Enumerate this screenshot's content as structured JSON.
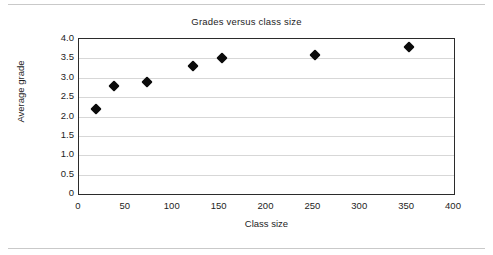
{
  "chart_data": {
    "type": "scatter",
    "title": "Grades versus class size",
    "xlabel": "Class size",
    "ylabel": "Average grade",
    "xlim": [
      0,
      400
    ],
    "ylim": [
      0,
      4.0
    ],
    "grid": true,
    "legend": null,
    "xticks": [
      "0",
      "50",
      "100",
      "150",
      "200",
      "250",
      "300",
      "350",
      "400"
    ],
    "xtick_values": [
      0,
      50,
      100,
      150,
      200,
      250,
      300,
      350,
      400
    ],
    "yticks": [
      "0",
      "0.5",
      "1.0",
      "1.5",
      "2.0",
      "2.5",
      "3.0",
      "3.5",
      "4.0"
    ],
    "ytick_values": [
      0,
      0.5,
      1.0,
      1.5,
      2.0,
      2.5,
      3.0,
      3.5,
      4.0
    ],
    "marker": "diamond",
    "marker_color": "#0b0b0b",
    "points": [
      {
        "x": 18,
        "y": 2.2
      },
      {
        "x": 37,
        "y": 2.8
      },
      {
        "x": 72,
        "y": 2.9
      },
      {
        "x": 122,
        "y": 3.3
      },
      {
        "x": 152,
        "y": 3.5
      },
      {
        "x": 252,
        "y": 3.6
      },
      {
        "x": 352,
        "y": 3.8
      }
    ]
  }
}
